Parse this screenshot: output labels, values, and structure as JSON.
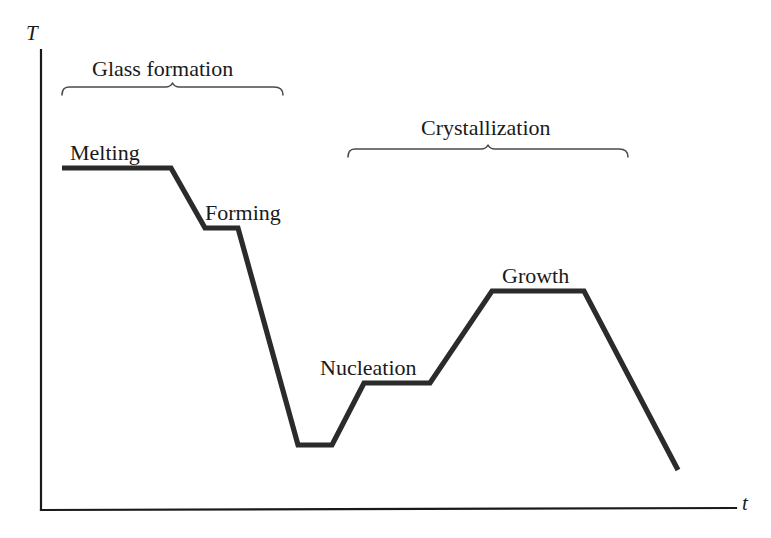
{
  "figure": {
    "background_color": "#ffffff",
    "line_color": "#2b2b2b",
    "axis_color": "#1a1a1a",
    "brace_color": "#4a4a4a"
  },
  "axes": {
    "y_label": "T",
    "x_label": "t",
    "y_label_position": {
      "x": 31,
      "y": 40
    },
    "x_label_position": {
      "x": 742,
      "y": 510
    },
    "y_axis": {
      "x": 41,
      "y_top": 50,
      "y_bottom": 510
    },
    "x_axis": {
      "y": 510,
      "x_left": 41,
      "x_right": 736
    }
  },
  "stage_labels": [
    {
      "name": "melting-label",
      "text": "Melting",
      "x": 70,
      "y": 160
    },
    {
      "name": "forming-label",
      "text": "Forming",
      "x": 205,
      "y": 220
    },
    {
      "name": "nucleation-label",
      "text": "Nucleation",
      "x": 320,
      "y": 375
    },
    {
      "name": "growth-label",
      "text": "Growth",
      "x": 502,
      "y": 283
    }
  ],
  "group_labels": [
    {
      "name": "glass-formation-label",
      "text": "Glass formation",
      "x": 92,
      "y": 76
    },
    {
      "name": "crystallization-label",
      "text": "Crystallization",
      "x": 421,
      "y": 135
    }
  ],
  "braces": [
    {
      "name": "glass-formation-brace",
      "x_start": 62,
      "x_end": 283,
      "y": 95,
      "tip_y": 83
    },
    {
      "name": "crystallization-brace",
      "x_start": 348,
      "x_end": 628,
      "y": 157,
      "tip_y": 145
    }
  ],
  "chart_data": {
    "type": "line",
    "title": "",
    "xlabel": "t",
    "ylabel": "T",
    "grid": false,
    "legend": "none",
    "series": [
      {
        "name": "Temperature profile",
        "points": [
          {
            "x": 62,
            "y": 168,
            "stage": "Melting",
            "note": "melting plateau start"
          },
          {
            "x": 171,
            "y": 168,
            "stage": "Melting",
            "note": "melting plateau end"
          },
          {
            "x": 205,
            "y": 228,
            "stage": "Forming",
            "note": "forming plateau start"
          },
          {
            "x": 238,
            "y": 228,
            "stage": "Forming",
            "note": "forming plateau end"
          },
          {
            "x": 298,
            "y": 445,
            "stage": "Quench",
            "note": "trough start"
          },
          {
            "x": 332,
            "y": 445,
            "stage": "Quench",
            "note": "trough end"
          },
          {
            "x": 364,
            "y": 383,
            "stage": "Nucleation",
            "note": "nucleation plateau start"
          },
          {
            "x": 430,
            "y": 383,
            "stage": "Nucleation",
            "note": "nucleation plateau end"
          },
          {
            "x": 492,
            "y": 291,
            "stage": "Growth",
            "note": "growth plateau start"
          },
          {
            "x": 584,
            "y": 291,
            "stage": "Growth",
            "note": "growth plateau end"
          },
          {
            "x": 678,
            "y": 470,
            "stage": "Cooling",
            "note": "final cool down"
          }
        ]
      }
    ],
    "annotations": [
      {
        "text": "Glass formation",
        "spans_x": [
          62,
          283
        ]
      },
      {
        "text": "Crystallization",
        "spans_x": [
          348,
          628
        ]
      },
      {
        "text": "Melting"
      },
      {
        "text": "Forming"
      },
      {
        "text": "Nucleation"
      },
      {
        "text": "Growth"
      }
    ],
    "axis_ranges": {
      "x": [
        41,
        736
      ],
      "y_pixels_top_is_high_temperature": true
    }
  }
}
